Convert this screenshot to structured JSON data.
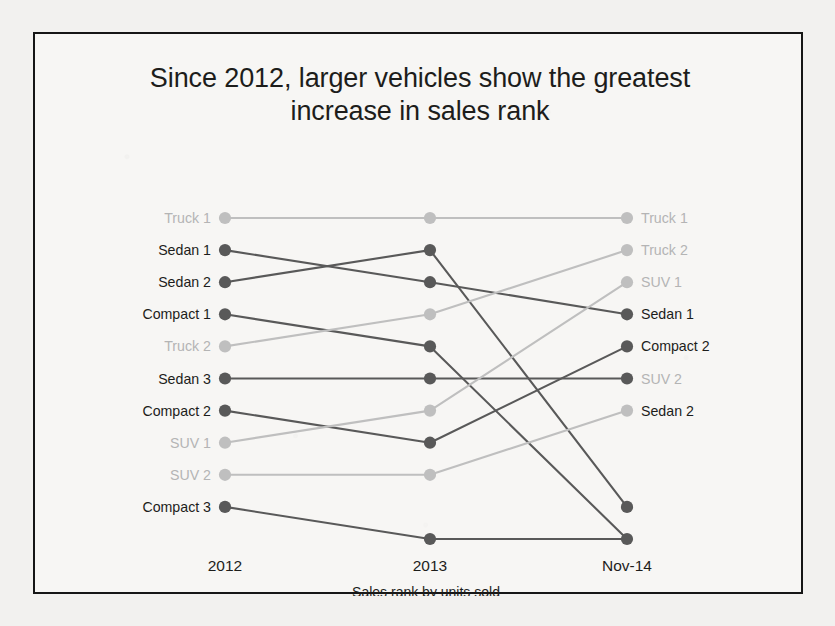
{
  "slide": {
    "title_line1": "Since 2012, larger vehicles show the greatest",
    "title_line2": "increase in sales rank"
  },
  "chart_data": {
    "type": "line",
    "subtype": "slopegraph",
    "title": "Since 2012, larger vehicles show the greatest increase in sales rank",
    "xlabel": "Sales rank by units sold",
    "ylabel": "",
    "categories": [
      "2012",
      "2013",
      "Nov-14"
    ],
    "grid": false,
    "legend": "none",
    "y_axis_inverted": true,
    "rank_note": "y position = sales rank, 1 = best (top)",
    "ylim": [
      1,
      11
    ],
    "colors": {
      "dark": "#595959",
      "light": "#bfbfbf",
      "label_dark": "#1d1d1b",
      "label_light": "#b4b4b4",
      "border": "#161616",
      "background": "#f7f6f4"
    },
    "series": [
      {
        "name": "Truck 1",
        "tone": "light",
        "values": [
          1,
          1,
          1
        ],
        "start_label": "Truck 1",
        "end_label": "Truck 1"
      },
      {
        "name": "Sedan 1",
        "tone": "dark",
        "values": [
          2,
          3,
          4
        ],
        "start_label": "Sedan 1",
        "end_label": "Sedan 1"
      },
      {
        "name": "Sedan 2",
        "tone": "dark",
        "values": [
          3,
          2,
          10
        ],
        "start_label": "Sedan 2",
        "end_label": ""
      },
      {
        "name": "Compact 1",
        "tone": "dark",
        "values": [
          4,
          5,
          11
        ],
        "start_label": "Compact 1",
        "end_label": ""
      },
      {
        "name": "Truck 2",
        "tone": "light",
        "values": [
          5,
          4,
          2
        ],
        "start_label": "Truck 2",
        "end_label": "Truck 2"
      },
      {
        "name": "Sedan 3",
        "tone": "dark",
        "values": [
          6,
          6,
          6
        ],
        "start_label": "Sedan 3",
        "end_label": "SUV 2"
      },
      {
        "name": "Compact 2",
        "tone": "dark",
        "values": [
          7,
          8,
          5
        ],
        "start_label": "Compact 2",
        "end_label": "Compact 2"
      },
      {
        "name": "SUV 1",
        "tone": "light",
        "values": [
          8,
          7,
          3
        ],
        "start_label": "SUV 1",
        "end_label": "SUV 1"
      },
      {
        "name": "SUV 2",
        "tone": "light",
        "values": [
          9,
          9,
          7
        ],
        "start_label": "SUV 2",
        "end_label": "Sedan 2"
      },
      {
        "name": "Compact 3",
        "tone": "dark",
        "values": [
          10,
          11,
          11
        ],
        "start_label": "Compact 3",
        "end_label": ""
      }
    ],
    "left_labels": [
      {
        "text": "Truck 1",
        "rank": 1,
        "tone": "light"
      },
      {
        "text": "Sedan 1",
        "rank": 2,
        "tone": "dark"
      },
      {
        "text": "Sedan 2",
        "rank": 3,
        "tone": "dark"
      },
      {
        "text": "Compact 1",
        "rank": 4,
        "tone": "dark"
      },
      {
        "text": "Truck 2",
        "rank": 5,
        "tone": "light"
      },
      {
        "text": "Sedan 3",
        "rank": 6,
        "tone": "dark"
      },
      {
        "text": "Compact 2",
        "rank": 7,
        "tone": "dark"
      },
      {
        "text": "SUV 1",
        "rank": 8,
        "tone": "light"
      },
      {
        "text": "SUV 2",
        "rank": 9,
        "tone": "light"
      },
      {
        "text": "Compact 3",
        "rank": 10,
        "tone": "dark"
      }
    ],
    "right_labels": [
      {
        "text": "Truck 1",
        "rank": 1,
        "tone": "light"
      },
      {
        "text": "Truck 2",
        "rank": 2,
        "tone": "light"
      },
      {
        "text": "SUV 1",
        "rank": 3,
        "tone": "light"
      },
      {
        "text": "Sedan 1",
        "rank": 4,
        "tone": "dark"
      },
      {
        "text": "Compact 2",
        "rank": 5,
        "tone": "dark"
      },
      {
        "text": "SUV 2",
        "rank": 6,
        "tone": "light"
      },
      {
        "text": "Sedan 2",
        "rank": 7,
        "tone": "dark"
      }
    ],
    "axis_ticks": [
      "2012",
      "2013",
      "Nov-14"
    ]
  }
}
